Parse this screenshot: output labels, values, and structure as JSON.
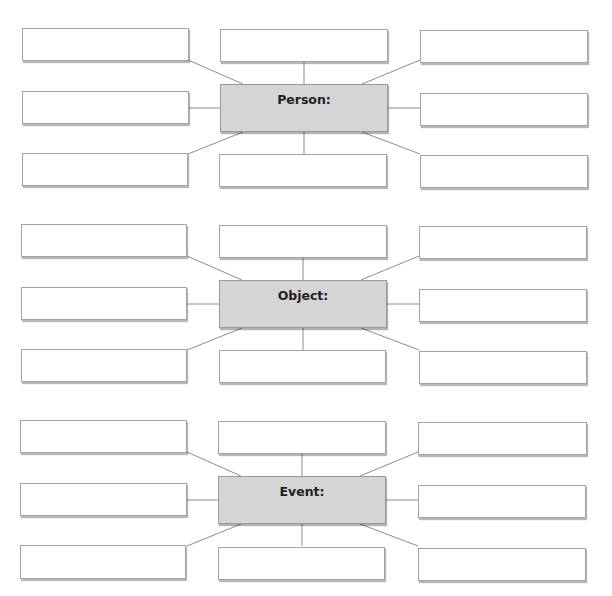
{
  "diagram": {
    "type": "graphic-organizer",
    "colors": {
      "center_fill": "#d5d5d5",
      "box_fill": "#ffffff",
      "border": "#a3a3a3",
      "connector": "#8c8c8c"
    },
    "groups": [
      {
        "id": "person",
        "center_label": "Person:",
        "top": 20,
        "satellites": [
          "",
          "",
          "",
          "",
          "",
          "",
          "",
          ""
        ]
      },
      {
        "id": "object",
        "center_label": "Object:",
        "top": 216,
        "satellites": [
          "",
          "",
          "",
          "",
          "",
          "",
          "",
          ""
        ]
      },
      {
        "id": "event",
        "center_label": "Event:",
        "top": 412,
        "satellites": [
          "",
          "",
          "",
          "",
          "",
          "",
          "",
          ""
        ]
      }
    ]
  }
}
